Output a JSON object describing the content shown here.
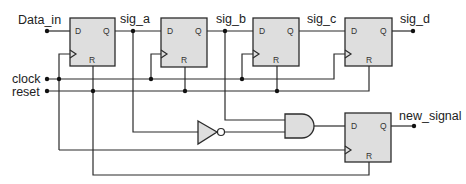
{
  "diagram": {
    "type": "digital-logic-schematic",
    "colors": {
      "wire": "#2b2b2b",
      "component_fill": "#dedede",
      "junction": "#111111"
    },
    "signals": {
      "data_in": "Data_in",
      "clock": "clock",
      "reset": "reset",
      "sig_a": "sig_a",
      "sig_b": "sig_b",
      "sig_c": "sig_c",
      "sig_d": "sig_d",
      "new_signal": "new_signal"
    },
    "flip_flops": [
      {
        "id": "ff1",
        "d": "D",
        "q": "Q",
        "r": "R"
      },
      {
        "id": "ff2",
        "d": "D",
        "q": "Q",
        "r": "R"
      },
      {
        "id": "ff3",
        "d": "D",
        "q": "Q",
        "r": "R"
      },
      {
        "id": "ff4",
        "d": "D",
        "q": "Q",
        "r": "R"
      },
      {
        "id": "ff5",
        "d": "D",
        "q": "Q",
        "r": "R"
      }
    ],
    "gates": [
      {
        "id": "not1",
        "type": "NOT",
        "input": "sig_a"
      },
      {
        "id": "and1",
        "type": "AND",
        "inputs": [
          "sig_b",
          "not(sig_a)"
        ],
        "output_to": "ff5.D"
      }
    ]
  }
}
